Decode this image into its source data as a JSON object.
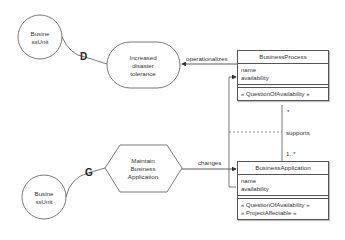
{
  "diagram": {
    "colors": {
      "stroke": "#555555",
      "text": "#333333",
      "background": "#ffffff"
    },
    "business_units": [
      {
        "label_line1": "Busine",
        "label_line2": "ssUnit"
      },
      {
        "label_line1": "Busine",
        "label_line2": "ssUnit"
      }
    ],
    "goal": {
      "line1": "Increased",
      "line2": "disaster",
      "line3": "tolerance"
    },
    "process_step": {
      "line1": "Maintain",
      "line2": "Business",
      "line3": "Application"
    },
    "connector_glyphs": {
      "top": "D",
      "bottom": "G"
    },
    "edges": {
      "operationalizes": "operationalizes",
      "changes": "changes",
      "supports": "supports",
      "mult_top": "*",
      "mult_bottom": "1..*"
    },
    "classes": {
      "business_process": {
        "name": "BusinessProcess",
        "attributes": [
          "name",
          "availability"
        ],
        "operations": [
          "« QuestionOfAvailability »"
        ]
      },
      "business_application": {
        "name": "BusinessApplication",
        "attributes": [
          "name",
          "availability"
        ],
        "operations": [
          "« QuestionOfAvailability »",
          "» ProjectAffectable »"
        ]
      }
    }
  }
}
